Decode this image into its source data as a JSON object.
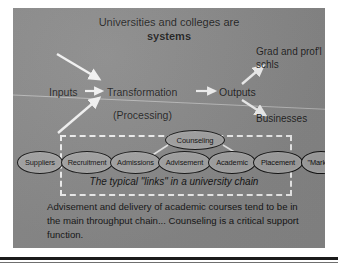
{
  "slide": {
    "title_line_1": "Universities and colleges are",
    "title_line_2": "systems",
    "background_color": "#8a8a8a",
    "flow": {
      "inputs_label": "Inputs",
      "transformation_label": "Transformation",
      "processing_label": "(Processing)",
      "outputs_label": "Outputs",
      "grad_schools_label": "Grad and prof'l schls",
      "businesses_label": "Businesses"
    },
    "chain": {
      "caption": "The typical \"links\" in a university chain",
      "support_node": "Counseling",
      "nodes": [
        {
          "label": "Suppliers"
        },
        {
          "label": "Recruitment"
        },
        {
          "label": "Admissions"
        },
        {
          "label": "Advisement"
        },
        {
          "label": "Academic"
        },
        {
          "label": "Placement"
        },
        {
          "label": "\"Market\""
        }
      ]
    },
    "footer_text": "Advisement and delivery of academic courses tend to be in the main throughput chain... Counseling is a critical support function."
  }
}
